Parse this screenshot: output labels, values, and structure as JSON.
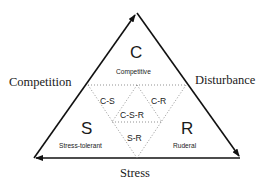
{
  "diagram": {
    "axes": {
      "left": "Competition",
      "right": "Disturbance",
      "bottom": "Stress"
    },
    "corners": [
      {
        "letter": "C",
        "label": "Competitive"
      },
      {
        "letter": "S",
        "label": "Stress-tolerant"
      },
      {
        "letter": "R",
        "label": "Ruderal"
      }
    ],
    "intermediate": [
      {
        "label": "C-S"
      },
      {
        "label": "C-R"
      },
      {
        "label": "C-S-R"
      },
      {
        "label": "S-R"
      }
    ],
    "colors": {
      "line": "#111111",
      "dotted": "#777777",
      "text": "#1a1a1a"
    }
  }
}
